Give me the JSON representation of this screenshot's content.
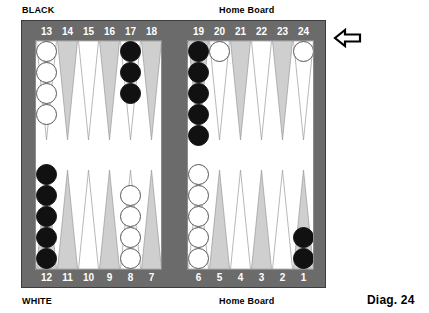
{
  "figure": {
    "caption": "Diag. 24",
    "labels": {
      "black": "BLACK",
      "white": "WHITE",
      "home_board_top": "Home Board",
      "home_board_bottom": "Home Board"
    },
    "arrow": {
      "icon": "arrow-left-icon",
      "direction": "left",
      "meaning": "black-direction-of-play"
    }
  },
  "colors": {
    "frame": "#6b6b6b",
    "surface": "#ffffff",
    "point_shaded": "#cfcfcf",
    "point_plain": "#ffffff",
    "checker_black": "#111111",
    "checker_white": "#ffffff",
    "number_text": "#ffffff",
    "caption_text": "#000000"
  },
  "board": {
    "type": "backgammon",
    "quadrants": {
      "top_left": "points-13-18",
      "top_right": "points-19-24-black-home-board",
      "bottom_left": "points-12-7",
      "bottom_right": "points-6-1-white-home-board"
    },
    "number_rows": {
      "top": [
        "13",
        "14",
        "15",
        "16",
        "17",
        "18",
        "19",
        "20",
        "21",
        "22",
        "23",
        "24"
      ],
      "bottom": [
        "12",
        "11",
        "10",
        "9",
        "8",
        "7",
        "6",
        "5",
        "4",
        "3",
        "2",
        "1"
      ]
    },
    "points": [
      {
        "number": "13",
        "row": "top",
        "quadrant": "top_left",
        "shade": "plain",
        "checkers": 4,
        "color": "white"
      },
      {
        "number": "14",
        "row": "top",
        "quadrant": "top_left",
        "shade": "shaded",
        "checkers": 0,
        "color": null
      },
      {
        "number": "15",
        "row": "top",
        "quadrant": "top_left",
        "shade": "plain",
        "checkers": 0,
        "color": null
      },
      {
        "number": "16",
        "row": "top",
        "quadrant": "top_left",
        "shade": "shaded",
        "checkers": 0,
        "color": null
      },
      {
        "number": "17",
        "row": "top",
        "quadrant": "top_left",
        "shade": "plain",
        "checkers": 3,
        "color": "black"
      },
      {
        "number": "18",
        "row": "top",
        "quadrant": "top_left",
        "shade": "shaded",
        "checkers": 0,
        "color": null
      },
      {
        "number": "19",
        "row": "top",
        "quadrant": "top_right",
        "shade": "shaded",
        "checkers": 5,
        "color": "black"
      },
      {
        "number": "20",
        "row": "top",
        "quadrant": "top_right",
        "shade": "plain",
        "checkers": 1,
        "color": "white"
      },
      {
        "number": "21",
        "row": "top",
        "quadrant": "top_right",
        "shade": "shaded",
        "checkers": 0,
        "color": null
      },
      {
        "number": "22",
        "row": "top",
        "quadrant": "top_right",
        "shade": "plain",
        "checkers": 0,
        "color": null
      },
      {
        "number": "23",
        "row": "top",
        "quadrant": "top_right",
        "shade": "shaded",
        "checkers": 0,
        "color": null
      },
      {
        "number": "24",
        "row": "top",
        "quadrant": "top_right",
        "shade": "plain",
        "checkers": 1,
        "color": "white"
      },
      {
        "number": "12",
        "row": "bottom",
        "quadrant": "bottom_left",
        "shade": "shaded",
        "checkers": 5,
        "color": "black"
      },
      {
        "number": "11",
        "row": "bottom",
        "quadrant": "bottom_left",
        "shade": "shaded",
        "checkers": 0,
        "color": null
      },
      {
        "number": "10",
        "row": "bottom",
        "quadrant": "bottom_left",
        "shade": "plain",
        "checkers": 0,
        "color": null
      },
      {
        "number": "9",
        "row": "bottom",
        "quadrant": "bottom_left",
        "shade": "shaded",
        "checkers": 0,
        "color": null
      },
      {
        "number": "8",
        "row": "bottom",
        "quadrant": "bottom_left",
        "shade": "plain",
        "checkers": 4,
        "color": "white"
      },
      {
        "number": "7",
        "row": "bottom",
        "quadrant": "bottom_left",
        "shade": "shaded",
        "checkers": 0,
        "color": null
      },
      {
        "number": "6",
        "row": "bottom",
        "quadrant": "bottom_right",
        "shade": "plain",
        "checkers": 5,
        "color": "white"
      },
      {
        "number": "5",
        "row": "bottom",
        "quadrant": "bottom_right",
        "shade": "shaded",
        "checkers": 0,
        "color": null
      },
      {
        "number": "4",
        "row": "bottom",
        "quadrant": "bottom_right",
        "shade": "plain",
        "checkers": 0,
        "color": null
      },
      {
        "number": "3",
        "row": "bottom",
        "quadrant": "bottom_right",
        "shade": "shaded",
        "checkers": 0,
        "color": null
      },
      {
        "number": "2",
        "row": "bottom",
        "quadrant": "bottom_right",
        "shade": "plain",
        "checkers": 0,
        "color": null
      },
      {
        "number": "1",
        "row": "bottom",
        "quadrant": "bottom_right",
        "shade": "shaded",
        "checkers": 2,
        "color": "black"
      }
    ],
    "totals": {
      "black_checkers": 15,
      "white_checkers": 15
    }
  }
}
